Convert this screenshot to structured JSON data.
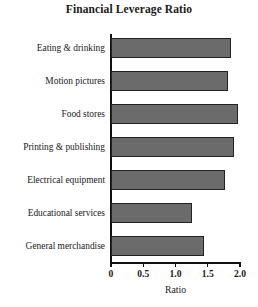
{
  "chart_data": {
    "type": "bar",
    "orientation": "horizontal",
    "title": "Financial Leverage Ratio",
    "xlabel": "Ratio",
    "ylabel": "",
    "categories": [
      "Eating & drinking",
      "Motion pictures",
      "Food stores",
      "Printing & publishing",
      "Electrical equipment",
      "Educational services",
      "General merchandise"
    ],
    "values": [
      1.86,
      1.81,
      1.97,
      1.9,
      1.77,
      1.26,
      1.44
    ],
    "xlim": [
      0,
      2.0
    ],
    "xticks": [
      0,
      0.5,
      1.0,
      1.5,
      2.0
    ],
    "xtick_labels": [
      "0",
      "0.5",
      "1.0",
      "1.5",
      "2.0"
    ],
    "grid": false,
    "legend": false,
    "bar_color": "#6b6b6b",
    "bar_edge_color": "#232323",
    "axis_color": "#111111",
    "background": "#ffffff"
  }
}
